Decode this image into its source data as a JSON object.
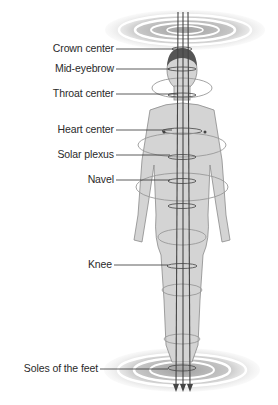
{
  "diagram": {
    "type": "energy centers of the human body",
    "labels": [
      {
        "id": "crown",
        "text": "Crown center",
        "y": 49
      },
      {
        "id": "mid-eyebrow",
        "text": "Mid-eyebrow",
        "y": 69
      },
      {
        "id": "throat",
        "text": "Throat center",
        "y": 94
      },
      {
        "id": "heart",
        "text": "Heart center",
        "y": 130
      },
      {
        "id": "solar-plexus",
        "text": "Solar plexus",
        "y": 155
      },
      {
        "id": "navel",
        "text": "Navel",
        "y": 180
      },
      {
        "id": "knee",
        "text": "Knee",
        "y": 265
      },
      {
        "id": "soles",
        "text": "Soles of the feet",
        "y": 369
      }
    ],
    "colors": {
      "body_fill": "#d4d4d4",
      "body_stroke": "#8a8a8a",
      "line": "#444444",
      "vortex": "#888888"
    }
  }
}
